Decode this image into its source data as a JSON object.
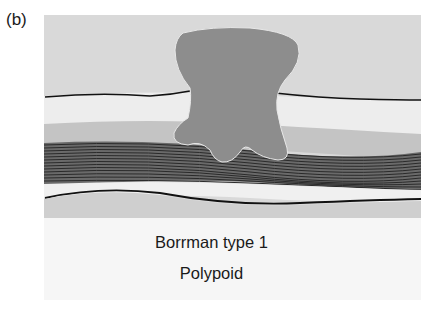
{
  "figure": {
    "panel_label": "(b)",
    "caption_line1": "Borrman type 1",
    "caption_line2": "Polypoid",
    "colors": {
      "lumen": "#d8d8d8",
      "mucosa": "#ececec",
      "submucosa": "#c9c9c9",
      "muscularis_lines": "#333333",
      "muscularis_bg": "#8a8a8a",
      "serosa": "#efefef",
      "subserosa": "#cfcfcf",
      "tumor": "#8c8c8c",
      "caption_bg": "#f6f6f6"
    },
    "layers": [
      "lumen",
      "mucosa",
      "submucosa",
      "muscularis propria",
      "serosa"
    ],
    "lesion": "polypoid tumor"
  }
}
